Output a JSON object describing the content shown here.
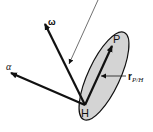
{
  "diagram": {
    "type": "rigid-body-kinematics",
    "labels": {
      "omega": "ω",
      "alpha": "α",
      "point_p": "P",
      "point_h": "H",
      "r_main": "r",
      "r_sub": "P/H"
    },
    "colors": {
      "body_fill": "#d4d4d4",
      "stroke": "#111111",
      "background": "#ffffff"
    }
  }
}
